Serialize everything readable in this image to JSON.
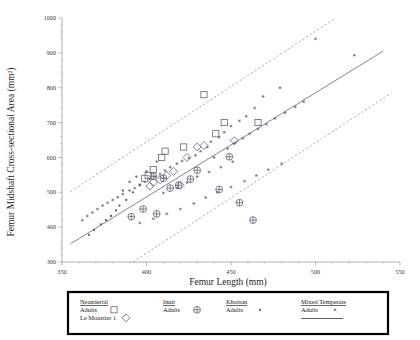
{
  "chart_data": {
    "type": "scatter",
    "title": "",
    "xlabel": "Femur Length (mm)",
    "ylabel": "Femur Midshaft Cross-sectional Area (mm²)",
    "xlim": [
      350,
      550
    ],
    "ylim": [
      300,
      1000
    ],
    "xticks": [
      350,
      400,
      450,
      500,
      550
    ],
    "xticklabels": [
      "350",
      "400",
      "450",
      "500",
      "550"
    ],
    "yticks": [
      300,
      400,
      500,
      600,
      700,
      800,
      900,
      1000
    ],
    "yticklabels": [
      "300",
      "400",
      "500",
      "600",
      "700",
      "800",
      "900",
      "1000"
    ],
    "grid": false,
    "legend_position": "below-axes",
    "series": [
      {
        "name": "Neandertal Adults",
        "marker": "open-square",
        "points": [
          [
            434,
            780
          ],
          [
            446,
            700
          ],
          [
            441,
            668
          ],
          [
            422,
            630
          ],
          [
            411,
            618
          ],
          [
            409,
            600
          ],
          [
            466,
            700
          ],
          [
            404,
            565
          ],
          [
            401,
            548
          ],
          [
            399,
            540
          ]
        ]
      },
      {
        "name": "Le Moustier 1",
        "marker": "open-diamond",
        "points": [
          [
            452,
            648
          ],
          [
            434,
            634
          ],
          [
            430,
            630
          ],
          [
            424,
            600
          ],
          [
            416,
            560
          ],
          [
            412,
            548
          ],
          [
            408,
            536
          ],
          [
            404,
            528
          ],
          [
            420,
            520
          ],
          [
            402,
            518
          ]
        ]
      },
      {
        "name": "Inuit Adults",
        "marker": "circle-plus",
        "points": [
          [
            449,
            602
          ],
          [
            430,
            563
          ],
          [
            426,
            538
          ],
          [
            419,
            520
          ],
          [
            414,
            512
          ],
          [
            443,
            508
          ],
          [
            455,
            470
          ],
          [
            398,
            452
          ],
          [
            406,
            438
          ],
          [
            391,
            430
          ],
          [
            463,
            420
          ],
          [
            404,
            546
          ],
          [
            410,
            540
          ]
        ]
      },
      {
        "name": "Khoisan Adults",
        "marker": "small-dot",
        "points": [
          [
            400,
            560
          ],
          [
            396,
            520
          ],
          [
            392,
            500
          ],
          [
            388,
            478
          ],
          [
            384,
            462
          ],
          [
            382,
            448
          ],
          [
            379,
            432
          ],
          [
            376,
            420
          ],
          [
            373,
            408
          ],
          [
            369,
            392
          ],
          [
            366,
            378
          ],
          [
            406,
            588
          ],
          [
            394,
            545
          ],
          [
            390,
            530
          ],
          [
            386,
            505
          ]
        ]
      },
      {
        "name": "Mixed Temperate Adults",
        "marker": "asterisk",
        "points": [
          [
            500,
            940
          ],
          [
            523,
            893
          ],
          [
            479,
            800
          ],
          [
            469,
            775
          ],
          [
            464,
            742
          ],
          [
            459,
            718
          ],
          [
            455,
            705
          ],
          [
            450,
            690
          ],
          [
            446,
            672
          ],
          [
            443,
            658
          ],
          [
            438,
            645
          ],
          [
            436,
            630
          ],
          [
            432,
            618
          ],
          [
            429,
            606
          ],
          [
            425,
            598
          ],
          [
            421,
            590
          ],
          [
            418,
            582
          ],
          [
            414,
            572
          ],
          [
            411,
            562
          ],
          [
            408,
            552
          ],
          [
            405,
            545
          ],
          [
            402,
            538
          ],
          [
            399,
            530
          ],
          [
            396,
            522
          ],
          [
            393,
            512
          ],
          [
            390,
            505
          ],
          [
            386,
            495
          ],
          [
            383,
            486
          ],
          [
            380,
            478
          ],
          [
            377,
            470
          ],
          [
            374,
            462
          ],
          [
            371,
            452
          ],
          [
            368,
            442
          ],
          [
            365,
            432
          ],
          [
            362,
            420
          ],
          [
            440,
            600
          ],
          [
            448,
            625
          ],
          [
            452,
            640
          ],
          [
            457,
            655
          ],
          [
            461,
            668
          ],
          [
            466,
            682
          ],
          [
            471,
            695
          ],
          [
            476,
            712
          ],
          [
            482,
            728
          ],
          [
            488,
            745
          ],
          [
            493,
            760
          ],
          [
            420,
            452
          ],
          [
            428,
            468
          ],
          [
            435,
            485
          ],
          [
            442,
            500
          ],
          [
            450,
            515
          ],
          [
            458,
            532
          ],
          [
            465,
            548
          ],
          [
            472,
            565
          ],
          [
            480,
            582
          ],
          [
            412,
            438
          ],
          [
            404,
            424
          ],
          [
            396,
            412
          ],
          [
            410,
            498
          ],
          [
            418,
            512
          ],
          [
            424,
            528
          ],
          [
            430,
            545
          ],
          [
            437,
            558
          ],
          [
            444,
            572
          ],
          [
            451,
            588
          ]
        ]
      }
    ],
    "fit_line": {
      "x": [
        355,
        540
      ],
      "y": [
        352,
        905
      ],
      "style": "solid"
    },
    "confidence_bands": [
      {
        "x": [
          355,
          512
        ],
        "y": [
          502,
          1000
        ],
        "style": "dashed"
      },
      {
        "x": [
          392,
          545
        ],
        "y": [
          300,
          785
        ],
        "style": "dashed"
      }
    ]
  },
  "legend": {
    "columns": [
      {
        "header": "Neandertal",
        "entries": [
          {
            "label": "Adults",
            "marker": "open-square"
          },
          {
            "label": "Le Moustier 1",
            "marker": "open-diamond"
          }
        ]
      },
      {
        "header": "Inuit",
        "entries": [
          {
            "label": "Adults",
            "marker": "circle-plus"
          }
        ]
      },
      {
        "header": "Khoisan",
        "entries": [
          {
            "label": "Adults",
            "marker": "small-dot"
          }
        ]
      },
      {
        "header": "Mixed Temperate",
        "entries": [
          {
            "label": "Adults",
            "marker": "asterisk"
          }
        ]
      }
    ]
  },
  "colors": {
    "marker": "#5a5a70",
    "fit_line": "#6e6e84",
    "axis": "#9a9a9a",
    "legend_border": "#000000",
    "text": "#1a1a1a"
  }
}
